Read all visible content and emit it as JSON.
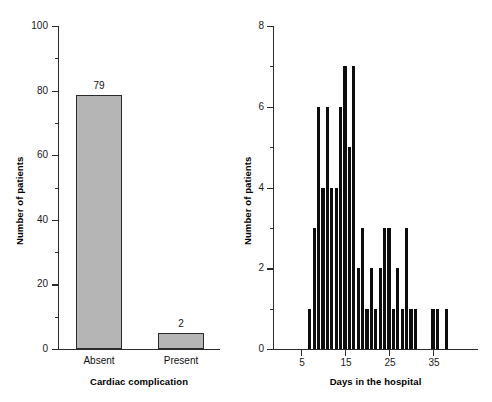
{
  "figure": {
    "background": "#ffffff",
    "axis_color": "#2b2b2b"
  },
  "chart_data": [
    {
      "type": "bar",
      "panel": "left",
      "title": "",
      "xlabel": "Cardiac complication",
      "ylabel": "Number of patients",
      "categories": [
        "Absent",
        "Present"
      ],
      "values": [
        79,
        2
      ],
      "value_labels": [
        "79",
        "2"
      ],
      "ylim": [
        0,
        100
      ],
      "yticks": [
        0,
        20,
        40,
        60,
        80,
        100
      ],
      "ytick_labels": [
        "0",
        "20",
        "40",
        "60",
        "80",
        "100"
      ],
      "yminor_ticks": [
        10,
        30,
        50,
        70,
        90
      ],
      "grid": false,
      "legend": false,
      "bar_fill": "#b5b5b5",
      "bar_edge": "#2b2b2b"
    },
    {
      "type": "bar",
      "panel": "right",
      "title": "",
      "xlabel": "Days in the hospital",
      "ylabel": "Number of patients",
      "x": [
        7,
        8,
        9,
        10,
        11,
        12,
        13,
        14,
        15,
        16,
        17,
        18,
        19,
        20,
        21,
        22,
        23,
        24,
        25,
        26,
        27,
        28,
        29,
        30,
        31,
        32,
        35,
        36,
        38
      ],
      "values": [
        1,
        3,
        6,
        4,
        6,
        4,
        4,
        6,
        7,
        5,
        7,
        2,
        3,
        1,
        2,
        1,
        2,
        3,
        3,
        1,
        2,
        1,
        3,
        1,
        1,
        0,
        1,
        1,
        1
      ],
      "xlim": [
        3,
        39
      ],
      "ylim": [
        0,
        8
      ],
      "yticks": [
        0,
        2,
        4,
        6,
        8
      ],
      "ytick_labels": [
        "0",
        "2",
        "4",
        "6",
        "8"
      ],
      "yminor_ticks": [
        1,
        3,
        5,
        7
      ],
      "xticks": [
        5,
        15,
        25,
        35
      ],
      "xtick_labels": [
        "5",
        "15",
        "25",
        "35"
      ],
      "grid": false,
      "legend": false,
      "bar_fill": "#0d0d0d"
    }
  ]
}
